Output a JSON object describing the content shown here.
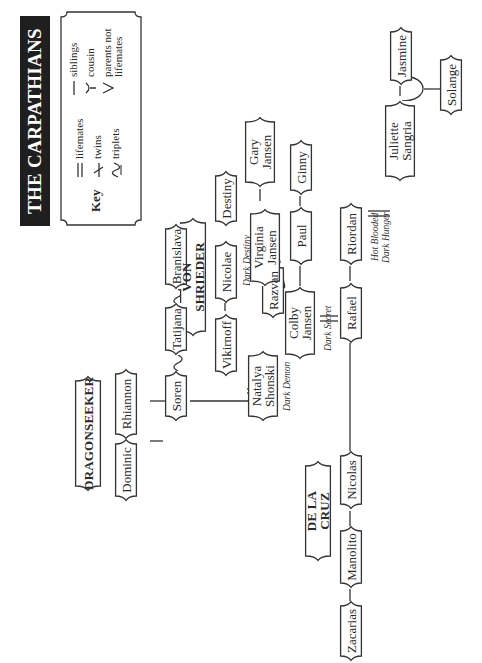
{
  "title": "THE CARPATHIANS",
  "key": {
    "title": "Key",
    "items": [
      {
        "symbol": "double-line",
        "label": "lifemates"
      },
      {
        "symbol": "twins-mark",
        "label": "twins"
      },
      {
        "symbol": "triplets-mark",
        "label": "triplets"
      },
      {
        "symbol": "single-line",
        "label": "siblings"
      },
      {
        "symbol": "y-mark",
        "label": "cousin"
      },
      {
        "symbol": "v-mark",
        "label": "parents not lifemates"
      }
    ]
  },
  "families": {
    "dragonseeker": "DRAGONSEEKER",
    "von_shrieder": "VON SHRIEDER",
    "de_la_cruz": "DE LA CRUZ"
  },
  "people": {
    "dominic": "Dominic",
    "rhiannon": "Rhiannon",
    "soren": "Soren",
    "tatijana": "Tatijana",
    "branislava": "Branislava",
    "vikirnoff": "Vikirnoff",
    "nicolae": "Nicolae",
    "destiny": "Destiny",
    "natalya_1": "Natalya",
    "natalya_2": "Shonski",
    "razvan": "Razvan",
    "virginia_1": "Virginia",
    "virginia_2": "Jansen",
    "gary_1": "Gary",
    "gary_2": "Jansen",
    "colby_1": "Colby",
    "colby_2": "Jansen",
    "paul": "Paul",
    "ginny": "Ginny",
    "rafael": "Rafael",
    "riordan": "Riordan",
    "juliette_1": "Juliette",
    "juliette_2": "Sangria",
    "jasmine": "Jasmine",
    "solange": "Solange",
    "nicolas": "Nicolas",
    "manolito": "Manolito",
    "zacarias": "Zacarias"
  },
  "books": {
    "dark_destiny": "Dark Destiny",
    "dark_demon": "Dark Demon",
    "dark_secret": "Dark Secret",
    "hot_blooded": "Hot Blooded",
    "dark_hunger": "Dark Hunger"
  }
}
